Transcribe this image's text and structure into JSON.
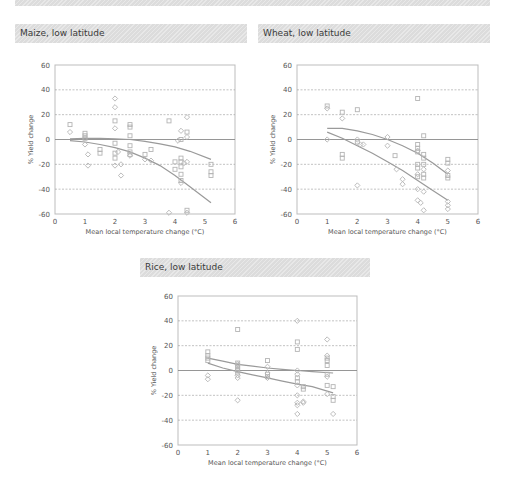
{
  "banner": {
    "label": ""
  },
  "colors": {
    "marker": "#b4b4b4",
    "fit": "#9a9a9a",
    "grid": "#9a9a9a",
    "axis": "#bdbdbd",
    "zero": "#8a8a8a"
  },
  "chart_data": [
    {
      "type": "scatter",
      "title": "Maize, low latitude",
      "xlabel": "Mean local temperature change (°C)",
      "ylabel": "% Yield change",
      "xlim": [
        0,
        6
      ],
      "ylim": [
        -60,
        60
      ],
      "xticks": [
        "0",
        "1",
        "2",
        "3",
        "4",
        "5",
        "6"
      ],
      "yticks": [
        "60",
        "40",
        "20",
        "0",
        "-20",
        "-40",
        "-60"
      ],
      "grid": "dashed horizontal at ±20, ±40",
      "series": [
        {
          "name": "with adaptation",
          "marker": "square",
          "points": [
            [
              0.5,
              12
            ],
            [
              1,
              5
            ],
            [
              1,
              3
            ],
            [
              1,
              1
            ],
            [
              1.5,
              -8
            ],
            [
              1.5,
              -11
            ],
            [
              2,
              -3
            ],
            [
              2,
              -11
            ],
            [
              2,
              -15
            ],
            [
              2,
              15
            ],
            [
              2.5,
              12
            ],
            [
              2.5,
              10
            ],
            [
              2.5,
              3
            ],
            [
              2.5,
              -5
            ],
            [
              2.5,
              -10
            ],
            [
              2.5,
              -12
            ],
            [
              3,
              -12
            ],
            [
              3.2,
              -8
            ],
            [
              3.8,
              15
            ],
            [
              4,
              -18
            ],
            [
              4,
              -24
            ],
            [
              4.2,
              0
            ],
            [
              4.2,
              -15
            ],
            [
              4.2,
              -18
            ],
            [
              4.2,
              -22
            ],
            [
              4.2,
              -28
            ],
            [
              4.2,
              -33
            ],
            [
              4.4,
              6
            ],
            [
              4.4,
              -57
            ],
            [
              5.2,
              -20
            ],
            [
              5.2,
              -26
            ],
            [
              5.2,
              -29
            ]
          ]
        },
        {
          "name": "without adaptation",
          "marker": "diamond",
          "points": [
            [
              0.5,
              6
            ],
            [
              1,
              -4
            ],
            [
              1.1,
              -12
            ],
            [
              1.1,
              -21
            ],
            [
              2,
              33
            ],
            [
              2,
              26
            ],
            [
              2,
              9
            ],
            [
              2,
              -21
            ],
            [
              2.1,
              -10
            ],
            [
              2.2,
              -20
            ],
            [
              2.2,
              -29
            ],
            [
              2.5,
              -13
            ],
            [
              3,
              -16
            ],
            [
              3.2,
              -17
            ],
            [
              3.8,
              -59
            ],
            [
              4.1,
              -1
            ],
            [
              4.2,
              7
            ],
            [
              4.2,
              -35
            ],
            [
              4.3,
              -19
            ],
            [
              4.4,
              18
            ],
            [
              4.4,
              2
            ],
            [
              4.4,
              -18
            ],
            [
              4.4,
              -59
            ]
          ]
        }
      ],
      "fits": [
        {
          "name": "with adaptation fit",
          "points": [
            [
              0.5,
              0.5
            ],
            [
              1,
              1
            ],
            [
              1.5,
              1
            ],
            [
              2,
              0.5
            ],
            [
              2.5,
              0
            ],
            [
              3,
              -1.5
            ],
            [
              3.5,
              -3.5
            ],
            [
              4,
              -6
            ],
            [
              4.5,
              -9.5
            ],
            [
              5.2,
              -16
            ]
          ]
        },
        {
          "name": "without adaptation fit",
          "points": [
            [
              0.5,
              -1
            ],
            [
              1,
              -2
            ],
            [
              1.5,
              -4
            ],
            [
              2,
              -6.5
            ],
            [
              2.5,
              -10
            ],
            [
              3,
              -15
            ],
            [
              3.5,
              -21
            ],
            [
              4,
              -29
            ],
            [
              4.5,
              -38
            ],
            [
              5.2,
              -51
            ]
          ]
        }
      ]
    },
    {
      "type": "scatter",
      "title": "Wheat, low latitude",
      "xlabel": "Mean local temperature change (°C)",
      "ylabel": "% Yield change",
      "xlim": [
        0,
        6
      ],
      "ylim": [
        -60,
        60
      ],
      "xticks": [
        "0",
        "1",
        "2",
        "3",
        "4",
        "5",
        "6"
      ],
      "yticks": [
        "60",
        "40",
        "20",
        "0",
        "-20",
        "-40",
        "-60"
      ],
      "grid": "dashed horizontal at ±20, ±40",
      "series": [
        {
          "name": "with adaptation",
          "marker": "square",
          "points": [
            [
              1,
              27
            ],
            [
              1.5,
              22
            ],
            [
              1.5,
              -12
            ],
            [
              1.5,
              -15
            ],
            [
              2,
              24
            ],
            [
              2,
              -2
            ],
            [
              3.25,
              -13
            ],
            [
              4,
              33
            ],
            [
              4,
              -4
            ],
            [
              4,
              -7
            ],
            [
              4,
              -10
            ],
            [
              4,
              -20
            ],
            [
              4,
              -23
            ],
            [
              4,
              -30
            ],
            [
              4.2,
              3
            ],
            [
              4.2,
              -12
            ],
            [
              4.2,
              -15
            ],
            [
              4.2,
              -20
            ],
            [
              4.2,
              -28
            ],
            [
              4.2,
              -31
            ],
            [
              5,
              -16
            ],
            [
              5,
              -19
            ],
            [
              5,
              -29
            ],
            [
              5,
              -31
            ]
          ]
        },
        {
          "name": "without adaptation",
          "marker": "diamond",
          "points": [
            [
              1,
              25
            ],
            [
              1,
              0
            ],
            [
              1.5,
              17
            ],
            [
              2,
              0
            ],
            [
              2,
              -37
            ],
            [
              2.1,
              -4
            ],
            [
              2.2,
              -4
            ],
            [
              3,
              2
            ],
            [
              3,
              -5
            ],
            [
              3.3,
              -24
            ],
            [
              3.5,
              -32
            ],
            [
              3.5,
              -36
            ],
            [
              4,
              -9
            ],
            [
              4,
              -28
            ],
            [
              4,
              -40
            ],
            [
              4,
              -49
            ],
            [
              4.1,
              -51
            ],
            [
              4.2,
              -24
            ],
            [
              4.2,
              -42
            ],
            [
              4.2,
              -57
            ],
            [
              5,
              -25
            ],
            [
              5,
              -50
            ],
            [
              5,
              -53
            ],
            [
              5,
              -56
            ]
          ]
        }
      ],
      "fits": [
        {
          "name": "with adaptation fit",
          "points": [
            [
              1,
              9
            ],
            [
              1.5,
              9
            ],
            [
              2,
              7
            ],
            [
              2.5,
              4
            ],
            [
              3,
              0
            ],
            [
              3.5,
              -5
            ],
            [
              4,
              -11
            ],
            [
              4.5,
              -19
            ],
            [
              5,
              -28
            ]
          ]
        },
        {
          "name": "without adaptation fit",
          "points": [
            [
              1,
              6
            ],
            [
              1.5,
              1
            ],
            [
              2,
              -5
            ],
            [
              2.5,
              -11
            ],
            [
              3,
              -18
            ],
            [
              3.5,
              -25
            ],
            [
              4,
              -33
            ],
            [
              4.5,
              -41
            ],
            [
              5,
              -49
            ]
          ]
        }
      ]
    },
    {
      "type": "scatter",
      "title": "Rice, low latitude",
      "xlabel": "Mean local temperature change (°C)",
      "ylabel": "% Yield change",
      "xlim": [
        0,
        6
      ],
      "ylim": [
        -60,
        60
      ],
      "xticks": [
        "0",
        "1",
        "2",
        "3",
        "4",
        "5",
        "6"
      ],
      "yticks": [
        "60",
        "40",
        "20",
        "0",
        "-20",
        "-40",
        "-60"
      ],
      "grid": "dashed horizontal at ±20, ±40",
      "series": [
        {
          "name": "with adaptation",
          "marker": "square",
          "points": [
            [
              1,
              15
            ],
            [
              1,
              12
            ],
            [
              1,
              10
            ],
            [
              1,
              8
            ],
            [
              2,
              33
            ],
            [
              2,
              6
            ],
            [
              2,
              4
            ],
            [
              2,
              2
            ],
            [
              2,
              0
            ],
            [
              2,
              -2
            ],
            [
              3,
              8
            ],
            [
              3,
              -3
            ],
            [
              3,
              -5
            ],
            [
              4,
              23
            ],
            [
              4,
              17
            ],
            [
              4,
              -6
            ],
            [
              4,
              -9
            ],
            [
              4.2,
              -13
            ],
            [
              4.2,
              -15
            ],
            [
              5,
              10
            ],
            [
              5,
              8
            ],
            [
              5,
              4
            ],
            [
              5,
              -3
            ],
            [
              5,
              -12
            ],
            [
              5.2,
              -13
            ],
            [
              5.2,
              -21
            ],
            [
              5.2,
              -24
            ]
          ]
        },
        {
          "name": "without adaptation",
          "marker": "diamond",
          "points": [
            [
              1,
              -4
            ],
            [
              1,
              -7
            ],
            [
              2,
              5
            ],
            [
              2,
              -4
            ],
            [
              2,
              -6
            ],
            [
              2,
              -24
            ],
            [
              3,
              3
            ],
            [
              3,
              -2
            ],
            [
              3,
              -6
            ],
            [
              4,
              40
            ],
            [
              4,
              0
            ],
            [
              4,
              -3
            ],
            [
              4,
              -12
            ],
            [
              4,
              -20
            ],
            [
              4,
              -26
            ],
            [
              4,
              -28
            ],
            [
              4,
              -35
            ],
            [
              4.2,
              -25
            ],
            [
              4.2,
              -26
            ],
            [
              5,
              25
            ],
            [
              5,
              12
            ],
            [
              5,
              -5
            ],
            [
              5,
              -19
            ],
            [
              5.2,
              -35
            ]
          ]
        }
      ],
      "fits": [
        {
          "name": "with adaptation fit",
          "points": [
            [
              1,
              10
            ],
            [
              1.5,
              7.5
            ],
            [
              2,
              5
            ],
            [
              2.5,
              3.5
            ],
            [
              3,
              2
            ],
            [
              3.5,
              1
            ],
            [
              4,
              0
            ],
            [
              4.5,
              -1
            ],
            [
              5.2,
              -2
            ]
          ]
        },
        {
          "name": "without adaptation fit",
          "points": [
            [
              1,
              6
            ],
            [
              1.5,
              2
            ],
            [
              2,
              -1
            ],
            [
              2.5,
              -3.5
            ],
            [
              3,
              -6
            ],
            [
              3.5,
              -8.5
            ],
            [
              4,
              -11
            ],
            [
              4.5,
              -13
            ],
            [
              5.2,
              -18
            ]
          ]
        }
      ]
    }
  ]
}
